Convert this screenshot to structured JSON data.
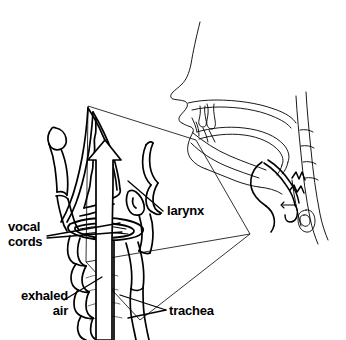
{
  "figure": {
    "style": "black line drawing on white background",
    "background_color": "#ffffff",
    "line_color": "#000000"
  },
  "labels": {
    "vocal_cords": {
      "line1": "vocal",
      "line2": "cords"
    },
    "exhaled_air": {
      "line1": "exhaled",
      "line2": "air"
    },
    "larynx": "larynx",
    "trachea": "trachea"
  },
  "parts": {
    "head_profile": "head-profile-sagittal-section",
    "nasal_cavity": "nasal-cavity",
    "oral_cavity": "oral-cavity",
    "tongue": "tongue",
    "soft_palate": "soft-palate",
    "pharynx": "pharynx",
    "epiglottis": "epiglottis",
    "cervical_spine": "cervical-spine",
    "magnified_larynx": "magnified-larynx-inset",
    "hyoid_bone": "hyoid-bone",
    "thyroid_cartilage": "thyroid-cartilage",
    "cricoid_cartilage": "cricoid-cartilage",
    "vocal_cord_ring": "vocal-cord-ring",
    "trachea_tube": "trachea-tube",
    "tracheal_rings": "tracheal-cartilage-rings",
    "airflow_arrow": "upward-airflow-arrow",
    "inset_frame": "magnification-callout-frame"
  }
}
